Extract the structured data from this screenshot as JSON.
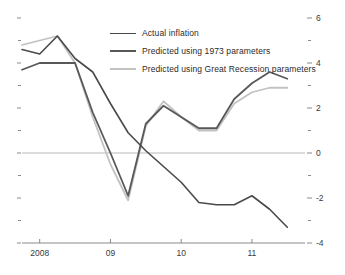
{
  "chart_data": {
    "type": "line",
    "title": "",
    "subtitle": "",
    "xlabel": "",
    "ylabel": "",
    "ylim": [
      -4,
      6
    ],
    "xlim": [
      2007.75,
      2011.75
    ],
    "grid": false,
    "zero_line": true,
    "legend_position": "top-center",
    "y_ticks_major": [
      6,
      4,
      2,
      0,
      -2,
      -4
    ],
    "y_ticks_minor": [
      5,
      3,
      1,
      -1,
      -3
    ],
    "y_tick_labels": [
      "6",
      "4",
      "2",
      "0",
      "-2",
      "-4"
    ],
    "x_ticks": [
      2008,
      2009,
      2010,
      2011
    ],
    "x_tick_labels": [
      "2008",
      "09",
      "10",
      "11"
    ],
    "series": [
      {
        "name": "Actual inflation",
        "color": "#4a4a4a",
        "width": 1.6,
        "x": [
          2007.75,
          2008.0,
          2008.25,
          2008.5,
          2008.75,
          2009.0,
          2009.25,
          2009.5,
          2009.75,
          2010.0,
          2010.25,
          2010.5,
          2010.75,
          2011.0,
          2011.25,
          2011.5
        ],
        "values": [
          4.6,
          4.4,
          5.2,
          4.2,
          3.6,
          2.2,
          0.9,
          0.1,
          -0.6,
          -1.3,
          -2.2,
          -2.3,
          -2.3,
          -1.9,
          -2.5,
          -3.3
        ]
      },
      {
        "name": "Predicted using 1973 parameters",
        "color": "#585858",
        "width": 1.8,
        "x": [
          2007.75,
          2008.0,
          2008.25,
          2008.5,
          2008.75,
          2009.0,
          2009.25,
          2009.5,
          2009.75,
          2010.0,
          2010.25,
          2010.5,
          2010.75,
          2011.0,
          2011.25,
          2011.5
        ],
        "values": [
          3.7,
          4.0,
          4.0,
          4.0,
          1.8,
          0.0,
          -1.9,
          1.3,
          2.1,
          1.6,
          1.1,
          1.1,
          2.4,
          3.1,
          3.6,
          3.3
        ]
      },
      {
        "name": "Predicted using Great Recession parameters",
        "color": "#c2c2c2",
        "width": 1.8,
        "x": [
          2007.75,
          2008.0,
          2008.25,
          2008.5,
          2008.75,
          2009.0,
          2009.25,
          2009.5,
          2009.75,
          2010.0,
          2010.25,
          2010.5,
          2010.75,
          2011.0,
          2011.25,
          2011.5
        ],
        "values": [
          4.8,
          5.0,
          5.2,
          4.0,
          1.6,
          -0.5,
          -2.1,
          1.2,
          2.3,
          1.6,
          1.0,
          1.0,
          2.2,
          2.7,
          2.9,
          2.9
        ]
      }
    ]
  },
  "legend": {
    "items": [
      {
        "label": "Actual inflation",
        "color": "#4a4a4a",
        "width": "1.6px"
      },
      {
        "label": "Predicted using 1973 parameters",
        "color": "#585858",
        "width": "2.1px"
      },
      {
        "label": "Predicted using Great Recession parameters",
        "color": "#c2c2c2",
        "width": "2.1px"
      }
    ]
  },
  "axes": {
    "right_labels": [
      "6",
      "4",
      "2",
      "0",
      "-2",
      "-4"
    ],
    "bottom_labels": [
      "2008",
      "09",
      "10",
      "11"
    ]
  },
  "colors": {
    "axis": "#8a8a8a",
    "zero_line": "#b9b9b9",
    "text": "#3a3a3a",
    "background": "#ffffff"
  }
}
